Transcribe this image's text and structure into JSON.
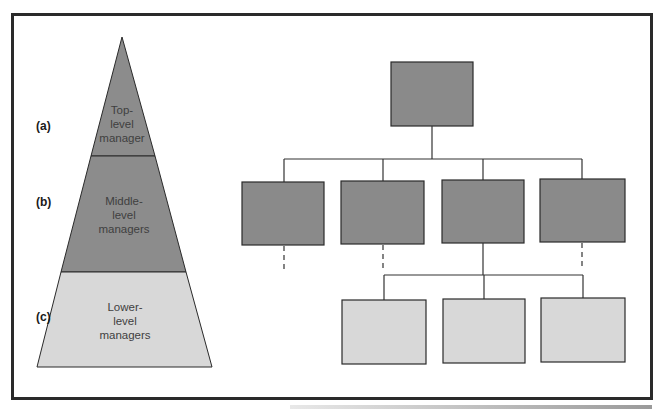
{
  "pyramid": {
    "levels": [
      {
        "marker": "(a)",
        "lines": [
          "Top-",
          "level",
          "manager"
        ],
        "fill": "#8c8c8c"
      },
      {
        "marker": "(b)",
        "lines": [
          "Middle-",
          "level",
          "managers"
        ],
        "fill": "#8c8c8c"
      },
      {
        "marker": "(c)",
        "lines": [
          "Lower-",
          "level",
          "managers"
        ],
        "fill": "#d8d8d8"
      }
    ]
  },
  "org_chart": {
    "top": {
      "count": 1,
      "fill": "#8a8a8a"
    },
    "middle": {
      "count": 4,
      "fill": "#8a8a8a",
      "dashed_below": [
        1,
        2,
        4
      ]
    },
    "lower": {
      "count": 3,
      "fill": "#d8d8d8",
      "parent_index": 3
    }
  },
  "colors": {
    "frame": "#2a2a2a",
    "line": "#333333",
    "dark_fill": "#8a8a8a",
    "light_fill": "#d8d8d8"
  }
}
